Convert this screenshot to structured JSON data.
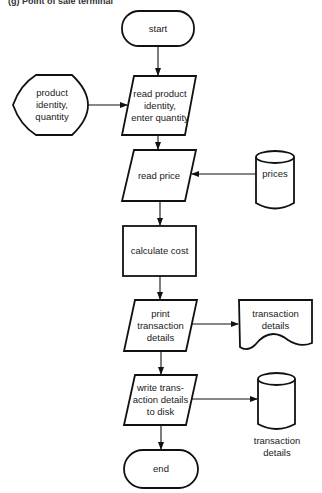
{
  "caption": "(g) Point of sale terminal",
  "nodes": {
    "start": {
      "type": "terminal",
      "label": "start"
    },
    "product_input": {
      "type": "display",
      "lines": [
        "product",
        "identity,",
        "quantity"
      ]
    },
    "read_product": {
      "type": "input-output",
      "lines": [
        "read product",
        "identity,",
        "enter quantity"
      ]
    },
    "read_price": {
      "type": "input-output",
      "label": "read price"
    },
    "prices": {
      "type": "stored-data",
      "label": "prices"
    },
    "calculate_cost": {
      "type": "process",
      "label": "calculate cost"
    },
    "print_details": {
      "type": "input-output",
      "lines": [
        "print",
        "transaction",
        "details"
      ]
    },
    "transaction_doc": {
      "type": "document",
      "lines": [
        "transaction",
        "details"
      ]
    },
    "write_disk": {
      "type": "input-output",
      "lines": [
        "write trans-",
        "action details",
        "to disk"
      ]
    },
    "transaction_disk": {
      "type": "stored-data",
      "lines": [
        "transaction",
        "details"
      ]
    },
    "end": {
      "type": "terminal",
      "label": "end"
    }
  },
  "edges": [
    {
      "from": "start",
      "to": "read_product"
    },
    {
      "from": "product_input",
      "to": "read_product"
    },
    {
      "from": "read_product",
      "to": "read_price"
    },
    {
      "from": "prices",
      "to": "read_price"
    },
    {
      "from": "read_price",
      "to": "calculate_cost"
    },
    {
      "from": "calculate_cost",
      "to": "print_details"
    },
    {
      "from": "print_details",
      "to": "transaction_doc"
    },
    {
      "from": "print_details",
      "to": "write_disk"
    },
    {
      "from": "write_disk",
      "to": "transaction_disk"
    },
    {
      "from": "write_disk",
      "to": "end"
    }
  ],
  "colors": {
    "stroke": "#111111",
    "fill": "#ffffff",
    "text": "#1a1a1a"
  }
}
